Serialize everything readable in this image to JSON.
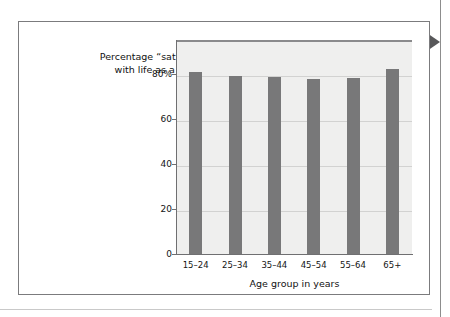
{
  "chart_data": {
    "type": "bar",
    "title": "Percentage “satisfied”\nwith life as a whole",
    "xlabel": "Age group in years",
    "ylabel": "",
    "categories": [
      "15–24",
      "25–34",
      "35–44",
      "45–54",
      "55–64",
      "65+"
    ],
    "values": [
      81,
      79,
      78.5,
      77.5,
      78,
      82
    ],
    "ylim": [
      0,
      95
    ],
    "yticks": [
      0,
      20,
      40,
      60,
      80
    ],
    "ytick_labels": [
      "0",
      "20",
      "40",
      "60",
      "80%"
    ],
    "grid": true,
    "legend": "none",
    "bar_color": "#787879",
    "plot_background": "#efefee",
    "gridline_color": "#d2d2d1",
    "axis_color": "#6f6f71"
  },
  "figure": {
    "card_border_color": "#7b7b7d",
    "page_background": "#ffffff"
  },
  "annotations": {
    "marker_icon": "right-pointing-triangle",
    "marker_color": "#58585a",
    "right_rule_color": "#8d8d8d",
    "bottom_rule_color": "#c9c9c9"
  }
}
